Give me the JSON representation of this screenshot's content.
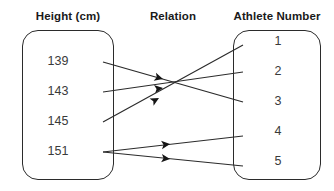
{
  "diagram": {
    "type": "mapping-diagram",
    "headings": {
      "left": "Height (cm)",
      "middle": "Relation",
      "right": "Athlete Number"
    },
    "left_set": {
      "name": "Height (cm)",
      "members": [
        {
          "label": "139",
          "y": 62
        },
        {
          "label": "143",
          "y": 92
        },
        {
          "label": "145",
          "y": 122
        },
        {
          "label": "151",
          "y": 152
        }
      ]
    },
    "right_set": {
      "name": "Athlete Number",
      "members": [
        {
          "label": "1",
          "y": 42
        },
        {
          "label": "2",
          "y": 72
        },
        {
          "label": "3",
          "y": 102
        },
        {
          "label": "4",
          "y": 132
        },
        {
          "label": "5",
          "y": 162
        }
      ]
    },
    "mappings": [
      {
        "from": "139",
        "to": "3",
        "x1": 103,
        "y1": 62,
        "x2": 243,
        "y2": 102,
        "ax": 163,
        "ay": 79
      },
      {
        "from": "143",
        "to": "2",
        "x1": 103,
        "y1": 92,
        "x2": 243,
        "y2": 72,
        "ax": 163,
        "ay": 88
      },
      {
        "from": "145",
        "to": "1",
        "x1": 103,
        "y1": 122,
        "x2": 243,
        "y2": 45,
        "ax": 159,
        "ay": 98
      },
      {
        "from": "151",
        "to": "4",
        "x1": 103,
        "y1": 152,
        "x2": 243,
        "y2": 136,
        "ax": 170,
        "ay": 144
      },
      {
        "from": "151",
        "to": "5",
        "x1": 103,
        "y1": 152,
        "x2": 243,
        "y2": 166,
        "ax": 170,
        "ay": 159
      }
    ],
    "colors": {
      "stroke": "#2b2b2b",
      "text": "#3a3a3a",
      "heading": "#1a1a1a",
      "background": "#ffffff"
    }
  }
}
